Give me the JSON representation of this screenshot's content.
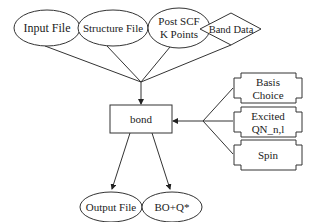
{
  "diagram": {
    "colors": {
      "stroke": "#333333",
      "text": "#222222",
      "background": "#ffffff"
    },
    "inputs": [
      {
        "id": "input-file",
        "shape": "ellipse",
        "lines": [
          "Input File"
        ]
      },
      {
        "id": "structure-file",
        "shape": "ellipse",
        "lines": [
          "Structure File"
        ]
      },
      {
        "id": "post-scf-k-points",
        "shape": "ellipse",
        "lines": [
          "Post SCF",
          "K Points"
        ]
      },
      {
        "id": "band-data",
        "shape": "diamond",
        "lines": [
          "Band Data"
        ]
      }
    ],
    "center": {
      "id": "bond",
      "shape": "rectangle",
      "label": "bond"
    },
    "options": [
      {
        "id": "basis-choice",
        "shape": "notched-box",
        "lines": [
          "Basis",
          "Choice"
        ]
      },
      {
        "id": "excited-qn",
        "shape": "notched-box",
        "lines": [
          "Excited",
          "QN_n,l"
        ]
      },
      {
        "id": "spin",
        "shape": "notched-box",
        "lines": [
          "Spin"
        ]
      }
    ],
    "outputs": [
      {
        "id": "output-file",
        "shape": "ellipse",
        "lines": [
          "Output File"
        ]
      },
      {
        "id": "bo-q",
        "shape": "ellipse",
        "lines": [
          "BO+Q*"
        ]
      }
    ],
    "edges": [
      {
        "from": "input-file",
        "to": "bond"
      },
      {
        "from": "structure-file",
        "to": "bond"
      },
      {
        "from": "post-scf-k-points",
        "to": "bond"
      },
      {
        "from": "band-data",
        "to": "bond"
      },
      {
        "from": "basis-choice",
        "to": "bond"
      },
      {
        "from": "excited-qn",
        "to": "bond"
      },
      {
        "from": "spin",
        "to": "bond"
      },
      {
        "from": "bond",
        "to": "output-file"
      },
      {
        "from": "bond",
        "to": "bo-q"
      }
    ]
  }
}
